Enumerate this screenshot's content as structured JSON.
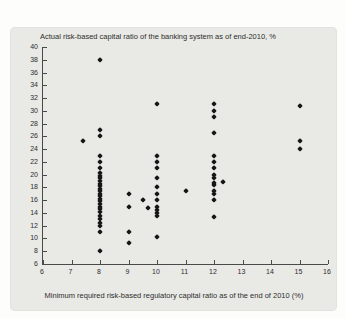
{
  "figure": {
    "title": "Actual risk-based capital ratio of the banking system as of end-2010, %",
    "x_axis_title": "Minimum required risk-based regulatory capital ratio as of the end of 2010 (%)"
  },
  "colors": {
    "panel_background": "#e9e9e6",
    "page_background": "#fdfdfc",
    "marker": "#161614",
    "axis": "#4a4a48",
    "text": "#2e2e2c"
  },
  "chart_data": {
    "type": "scatter",
    "title": "Actual risk-based capital ratio of the banking system as of end-2010, %",
    "xlabel": "Minimum required risk-based regulatory capital ratio as of the end of 2010 (%)",
    "ylabel": "",
    "xlim": [
      6,
      16
    ],
    "ylim": [
      6,
      40
    ],
    "x_ticks": [
      6,
      7,
      8,
      9,
      10,
      11,
      12,
      13,
      14,
      15,
      16
    ],
    "y_ticks": [
      6,
      8,
      10,
      12,
      14,
      16,
      18,
      20,
      22,
      24,
      26,
      28,
      30,
      32,
      34,
      36,
      38,
      40
    ],
    "grid": false,
    "legend": "none",
    "marker": "diamond",
    "points": [
      [
        8,
        38
      ],
      [
        7.4,
        25.3
      ],
      [
        8,
        27
      ],
      [
        8,
        26
      ],
      [
        8,
        23
      ],
      [
        8,
        22
      ],
      [
        8,
        21
      ],
      [
        8,
        20.3
      ],
      [
        8,
        19.8
      ],
      [
        8,
        19.4
      ],
      [
        8,
        19.0
      ],
      [
        8,
        18.6
      ],
      [
        8,
        18.2
      ],
      [
        8,
        17.8
      ],
      [
        8,
        17.4
      ],
      [
        8,
        17.0
      ],
      [
        8,
        16.6
      ],
      [
        8,
        16.2
      ],
      [
        8,
        15.8
      ],
      [
        8,
        15.4
      ],
      [
        8,
        15.0
      ],
      [
        8,
        14.6
      ],
      [
        8,
        14.1
      ],
      [
        8,
        13.5
      ],
      [
        8,
        13.0
      ],
      [
        8,
        12.5
      ],
      [
        8,
        12.0
      ],
      [
        8,
        11
      ],
      [
        8,
        8
      ],
      [
        9,
        17
      ],
      [
        9,
        15
      ],
      [
        9,
        11
      ],
      [
        9,
        9.3
      ],
      [
        9.5,
        16
      ],
      [
        9.7,
        14.7
      ],
      [
        10,
        31
      ],
      [
        10,
        23
      ],
      [
        10,
        22
      ],
      [
        10,
        21
      ],
      [
        10,
        19.5
      ],
      [
        10,
        18
      ],
      [
        10,
        17
      ],
      [
        10,
        16
      ],
      [
        10,
        15
      ],
      [
        10,
        14.5
      ],
      [
        10,
        14
      ],
      [
        10,
        13.5
      ],
      [
        10,
        10.3
      ],
      [
        11,
        17.5
      ],
      [
        12,
        31
      ],
      [
        12,
        30
      ],
      [
        12,
        29
      ],
      [
        12,
        26.5
      ],
      [
        12,
        23
      ],
      [
        12,
        22
      ],
      [
        12,
        21
      ],
      [
        12,
        20
      ],
      [
        12,
        19.5
      ],
      [
        12,
        18.7
      ],
      [
        12,
        18.3
      ],
      [
        12,
        17.5
      ],
      [
        12,
        17
      ],
      [
        12,
        16
      ],
      [
        12,
        13.3
      ],
      [
        12.3,
        18.9
      ],
      [
        15,
        30.8
      ],
      [
        15,
        25.2
      ],
      [
        15,
        24
      ]
    ]
  }
}
